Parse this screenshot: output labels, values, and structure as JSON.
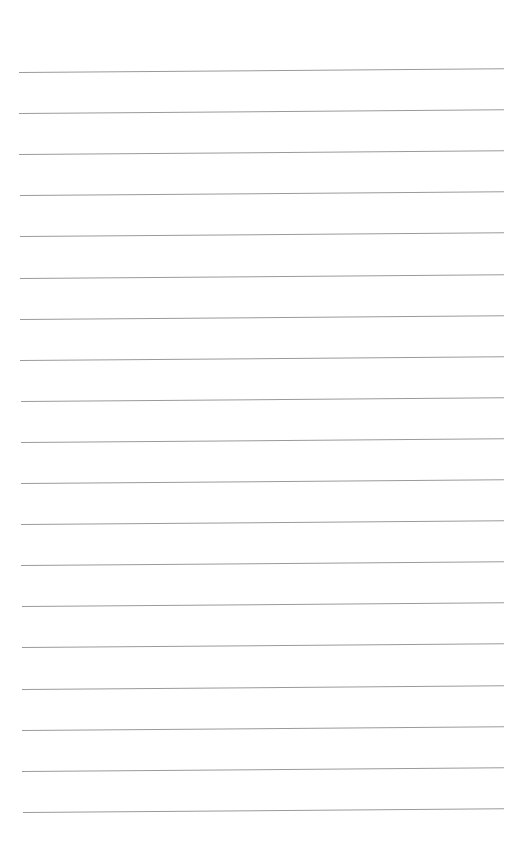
{
  "page": {
    "type": "lined-paper",
    "background": "#ffffff",
    "line_color": "#9a9a9a",
    "line_count": 19,
    "first_line_y": 72,
    "line_spacing": 41.1,
    "line_left_x": 19,
    "line_right_x": 504,
    "tilt_deg": -0.45
  },
  "text": []
}
